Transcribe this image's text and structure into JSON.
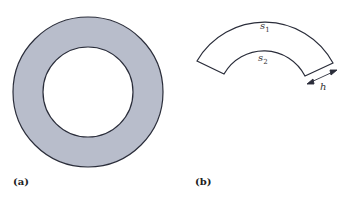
{
  "figure_a": {
    "label": "(a)",
    "shape": "annulus",
    "fill_color": "#b8bdcb",
    "stroke_color": "#2a2d3a"
  },
  "figure_b": {
    "label": "(b)",
    "shape": "annular-sector",
    "outer_arc_label": "s",
    "outer_arc_sub": "1",
    "inner_arc_label": "s",
    "inner_arc_sub": "2",
    "width_label": "h",
    "stroke_color": "#2a2d3a"
  }
}
